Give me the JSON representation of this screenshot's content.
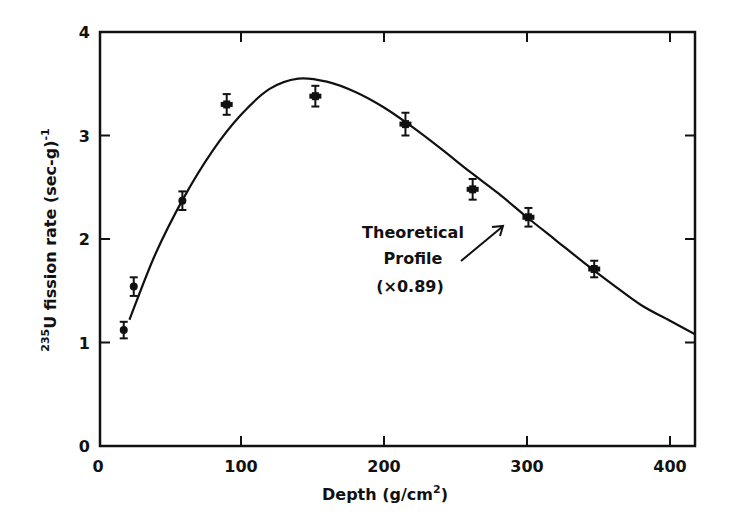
{
  "chart_data": {
    "type": "scatter",
    "title": "",
    "xlabel": "Depth (g/cm2)",
    "xlabel_parts": {
      "main": "Depth (g/cm",
      "sup": "2",
      "close": ")"
    },
    "ylabel": "235U fission rate (sec-g)-1",
    "ylabel_parts": {
      "pre_sup": "235",
      "main": "U fission rate (sec-g)",
      "sup": "-1"
    },
    "xlim": [
      0,
      420
    ],
    "ylim": [
      0,
      4
    ],
    "xticks": [
      0,
      100,
      200,
      300,
      400
    ],
    "xtick_labels": [
      "0",
      "100",
      "200",
      "300",
      "400"
    ],
    "yticks": [
      0,
      1,
      2,
      3,
      4
    ],
    "ytick_labels": [
      "0",
      "1",
      "2",
      "3",
      "4"
    ],
    "grid": false,
    "legend": null,
    "series": [
      {
        "name": "Measured",
        "kind": "points_with_errorbars",
        "x": [
          18,
          25,
          59,
          90,
          152,
          215,
          262,
          301,
          347
        ],
        "y": [
          1.12,
          1.54,
          2.37,
          3.3,
          3.38,
          3.11,
          2.48,
          2.21,
          1.71
        ],
        "yerr": [
          0.08,
          0.09,
          0.09,
          0.1,
          0.1,
          0.11,
          0.1,
          0.09,
          0.08
        ]
      },
      {
        "name": "Theoretical Profile (x0.89)",
        "kind": "line",
        "x": [
          22,
          40,
          60,
          80,
          100,
          120,
          140,
          160,
          180,
          200,
          220,
          240,
          260,
          280,
          300,
          320,
          340,
          360,
          380,
          400,
          420
        ],
        "y": [
          1.22,
          1.85,
          2.4,
          2.85,
          3.2,
          3.45,
          3.55,
          3.52,
          3.42,
          3.27,
          3.08,
          2.87,
          2.65,
          2.44,
          2.21,
          1.99,
          1.77,
          1.56,
          1.36,
          1.21,
          1.06
        ]
      }
    ],
    "annotations": [
      {
        "lines": [
          "Theoretical",
          "Profile",
          "(×0.89)"
        ],
        "arrow_to": [
          290,
          2.3
        ]
      }
    ]
  }
}
